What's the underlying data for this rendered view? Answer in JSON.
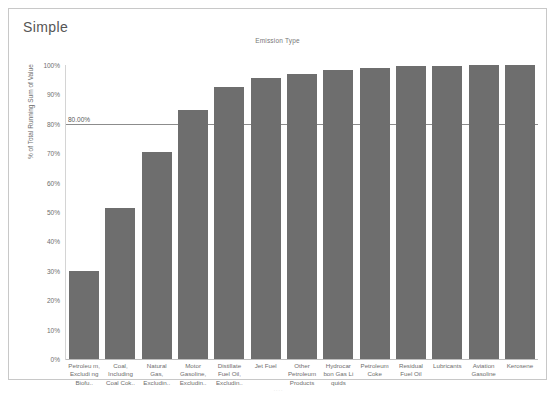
{
  "worksheet": {
    "title": "Simple"
  },
  "footer": {
    "mark": "...."
  },
  "chart_data": {
    "type": "bar",
    "title": "Emission Type",
    "xlabel": "",
    "ylabel": "% of Total Running Sum of Value",
    "ylim": [
      0,
      100
    ],
    "grid": false,
    "legend": "none",
    "y_ticks": [
      "0%",
      "10%",
      "20%",
      "30%",
      "40%",
      "50%",
      "60%",
      "70%",
      "80%",
      "90%",
      "100%"
    ],
    "y_tick_values": [
      0,
      10,
      20,
      30,
      40,
      50,
      60,
      70,
      80,
      90,
      100
    ],
    "bar_color": "#6e6e6e",
    "reference_line": {
      "label": "80.00%",
      "value": 80,
      "color": "#8c8c8c"
    },
    "categories": [
      "Petroleu m, Excludi ng Biofu..",
      "Coal, Including Coal Cok..",
      "Natural Gas, Excludin..",
      "Motor Gasoline, Excludin..",
      "Distillate Fuel Oil, Excludin..",
      "Jet Fuel",
      "Other Petroleum Products",
      "Hydrocar bon Gas Li quids",
      "Petroleum Coke",
      "Residual Fuel Oil",
      "Lubricants",
      "Aviation Gasoline",
      "Kerosene"
    ],
    "values": [
      29.8,
      51.4,
      70.4,
      84.6,
      92.6,
      95.6,
      96.9,
      98.2,
      98.9,
      99.6,
      99.8,
      99.9,
      100.0
    ]
  }
}
